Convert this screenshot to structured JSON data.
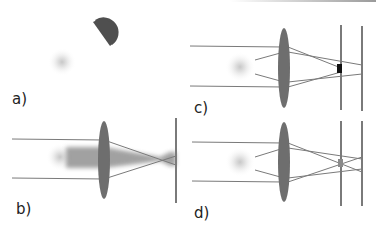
{
  "panels": {
    "a": {
      "label": "a)"
    },
    "b": {
      "label": "b)"
    },
    "c": {
      "label": "c)"
    },
    "d": {
      "label": "d)"
    }
  },
  "colors": {
    "lens": "#6e6e6e",
    "ray": "#7a7a7a",
    "screen": "#7a7a7a",
    "blur_spot": "#d8d8d8",
    "half_disc": "#4f4f4f",
    "detector": "#111111",
    "beam": "#8a8a8a"
  }
}
